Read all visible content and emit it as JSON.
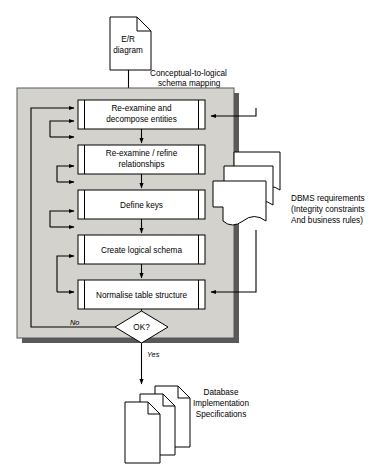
{
  "diagram": {
    "colors": {
      "panel_fill": "#d4d2cd",
      "panel_border": "#585858",
      "panel_shadow": "#595959",
      "shape_fill": "#ffffff",
      "stroke": "#000000"
    },
    "input_document": {
      "label_line1": "E/R",
      "label_line2": "diagram",
      "shape": "document-folded-corner"
    },
    "input_edge": {
      "label_line1": "Conceptual-to-logical",
      "label_line2": "schema mapping"
    },
    "process_steps": [
      {
        "id": "step-1",
        "line1": "Re-examine and",
        "line2": "decompose  entities"
      },
      {
        "id": "step-2",
        "line1": "Re-examine / refine",
        "line2": "relationships"
      },
      {
        "id": "step-3",
        "line1": "Define keys",
        "line2": ""
      },
      {
        "id": "step-4",
        "line1": "Create logical schema",
        "line2": ""
      },
      {
        "id": "step-5",
        "line1": "Normalise table structure",
        "line2": ""
      }
    ],
    "decision": {
      "label": "OK?",
      "yes_label": "Yes",
      "no_label": "No"
    },
    "side_documents": {
      "count": 3,
      "shape": "wavy-bottom-document",
      "label_line1": "DBMS requirements",
      "label_line2": "(Integrity constraints",
      "label_line3": "And business rules)"
    },
    "output_documents": {
      "count": 3,
      "shape": "stacked-folded-pages",
      "label_line1": "Database",
      "label_line2": "Implementation",
      "label_line3": "Specifications"
    }
  }
}
